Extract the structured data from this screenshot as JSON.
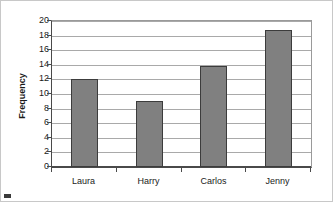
{
  "chart_data": {
    "type": "bar",
    "title": "",
    "subtitle": "",
    "xlabel": "",
    "ylabel": "Frequency",
    "categories": [
      "Laura",
      "Harry",
      "Carlos",
      "Jenny"
    ],
    "values": [
      12,
      9,
      13.9,
      18.7
    ],
    "series": [
      {
        "name": "Frequency",
        "values": [
          12,
          9,
          13.9,
          18.7
        ]
      }
    ],
    "ylim": [
      0,
      20
    ],
    "y_ticks": [
      0,
      2,
      4,
      6,
      8,
      10,
      12,
      14,
      16,
      18,
      20
    ],
    "y_tick_labels": [
      "0",
      "2",
      "4",
      "6",
      "8",
      "10",
      "12",
      "14",
      "16",
      "18",
      "20"
    ],
    "grid": true,
    "grid_axis": "y",
    "legend": false,
    "legend_position": "none",
    "annotations": [],
    "colors": {
      "bar_fill": "#808080",
      "bar_border": "#3c3c3c",
      "gridline": "#a9a9a9",
      "axis": "#4a4a4a",
      "frame": "#c8c8c8",
      "text": "#1a1a1a",
      "background": "#ffffff"
    }
  }
}
